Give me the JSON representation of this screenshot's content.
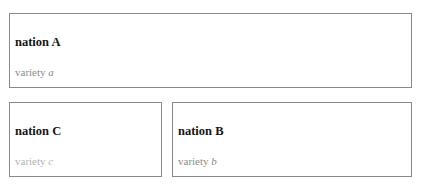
{
  "boxes": {
    "a": {
      "title": "nation A",
      "variety_prefix": "variety",
      "variety_letter": "a",
      "variety_color": "#8c8c8c"
    },
    "c": {
      "title": "nation C",
      "variety_prefix": "variety",
      "variety_letter": "c",
      "variety_color": "#b3b3b3"
    },
    "b": {
      "title": "nation B",
      "variety_prefix": "variety",
      "variety_letter": "b",
      "variety_color": "#8c8c8c"
    }
  }
}
